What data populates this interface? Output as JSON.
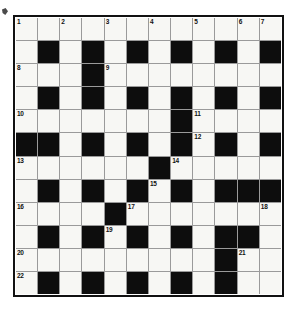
{
  "puzzle": {
    "title": "Crossword Grid",
    "rows": 12,
    "columns": 12,
    "colors": {
      "block": "#0d0d0d",
      "open": "#f7f7f4",
      "gridline": "#9a9a9a",
      "border": "#111111",
      "number_text": "#111111",
      "page_background": "#ffffff"
    },
    "layout": {
      "block_char": "#",
      "open_char": ".",
      "grid": [
        "............",
        ".#.#.#.#.#.#",
        "...#........",
        ".#.#.#.#.#.#",
        ".......#....",
        "##.#.#.#.#.#",
        "......#.....",
        ".#.#.#.#.###",
        "....#.......",
        ".#.#.#.#.##.",
        ".........#..",
        ".#.#.#.#.#.."
      ]
    },
    "numbers": [
      {
        "label": "1",
        "row": 1,
        "col": 1
      },
      {
        "label": "2",
        "row": 1,
        "col": 3
      },
      {
        "label": "3",
        "row": 1,
        "col": 5
      },
      {
        "label": "4",
        "row": 1,
        "col": 7
      },
      {
        "label": "5",
        "row": 1,
        "col": 9
      },
      {
        "label": "6",
        "row": 1,
        "col": 11
      },
      {
        "label": "7",
        "row": 1,
        "col": 12
      },
      {
        "label": "8",
        "row": 3,
        "col": 1
      },
      {
        "label": "9",
        "row": 3,
        "col": 5
      },
      {
        "label": "10",
        "row": 5,
        "col": 1
      },
      {
        "label": "11",
        "row": 5,
        "col": 9
      },
      {
        "label": "12",
        "row": 6,
        "col": 9
      },
      {
        "label": "13",
        "row": 7,
        "col": 1
      },
      {
        "label": "14",
        "row": 7,
        "col": 8
      },
      {
        "label": "15",
        "row": 8,
        "col": 7
      },
      {
        "label": "16",
        "row": 9,
        "col": 1
      },
      {
        "label": "17",
        "row": 9,
        "col": 6
      },
      {
        "label": "18",
        "row": 9,
        "col": 12
      },
      {
        "label": "19",
        "row": 10,
        "col": 5
      },
      {
        "label": "20",
        "row": 11,
        "col": 1
      },
      {
        "label": "21",
        "row": 11,
        "col": 11
      },
      {
        "label": "22",
        "row": 12,
        "col": 1
      }
    ]
  }
}
